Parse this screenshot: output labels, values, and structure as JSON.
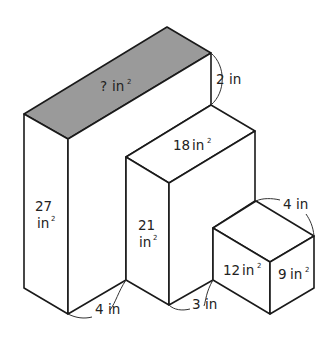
{
  "colors": {
    "shaded_face": "#9a9a9a",
    "plain_face": "#ffffff",
    "stroke": "#1a1a1a"
  },
  "labels": {
    "big_top": {
      "value": "?",
      "unit": "in",
      "exp": "2"
    },
    "big_front": {
      "line1": "27",
      "unit": "in",
      "exp": "2"
    },
    "big_height_diff": "2 in",
    "big_depth": "4 in",
    "mid_top": {
      "value": "18",
      "unit": "in",
      "exp": "2"
    },
    "mid_front": {
      "line1": "21",
      "unit": "in",
      "exp": "2"
    },
    "mid_depth": "3 in",
    "small_front": {
      "value": "12",
      "unit": "in",
      "exp": "2"
    },
    "small_side": {
      "value": "9",
      "unit": "in",
      "exp": "2"
    },
    "small_width": "4 in"
  }
}
